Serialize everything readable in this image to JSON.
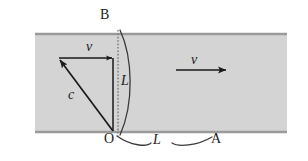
{
  "figure": {
    "width": 308,
    "height": 161,
    "background_color": "#ffffff"
  },
  "band": {
    "name": "medium-band",
    "fill_color": "#d4d4d4",
    "edge_color": "#a0a0a0",
    "x": 35,
    "y": 33,
    "width": 252,
    "height": 100
  },
  "labels": {
    "point_B": "B",
    "point_O": "O",
    "point_A": "A",
    "vector_v_triangle": "v",
    "vector_c": "c",
    "length_L_vertical": "L",
    "length_L_horizontal": "L",
    "flow_v": "v"
  },
  "elements": {
    "dotted_line": {
      "name": "dotted-vertical-line",
      "from_label": "B",
      "to_label": "O",
      "style": "dotted",
      "color": "#808080"
    },
    "arc_vertical": {
      "name": "vertical-length-brace",
      "label": "L",
      "color": "#3a3a3a"
    },
    "arc_horizontal": {
      "name": "horizontal-length-brace",
      "label": "L",
      "color": "#3a3a3a"
    },
    "triangle": {
      "name": "velocity-triangle",
      "legs": [
        "c",
        "v"
      ],
      "color": "#1a1a1a"
    },
    "flow_arrow": {
      "name": "flow-velocity-arrow",
      "label": "v",
      "direction": "right",
      "color": "#1a1a1a"
    }
  },
  "colors": {
    "ink": "#1a1a1a",
    "band_fill": "#d4d4d4",
    "band_edge": "#a0a0a0",
    "dotted": "#808080",
    "arc": "#3a3a3a"
  }
}
